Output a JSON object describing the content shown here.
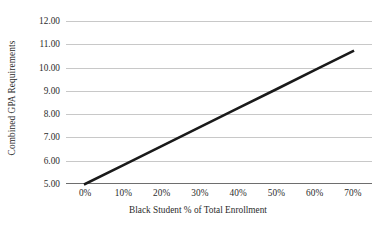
{
  "chart_data": {
    "type": "line",
    "title": "",
    "xlabel": "Black Student % of Total Enrollment",
    "ylabel": "Combined GPA Requirements",
    "x": [
      0,
      70
    ],
    "values": [
      5.0,
      10.7
    ],
    "series": [
      {
        "name": "Combined GPA Requirements",
        "x": [
          0,
          10,
          20,
          30,
          40,
          50,
          60,
          70
        ],
        "values": [
          5.0,
          5.81,
          6.63,
          7.44,
          8.26,
          9.07,
          9.89,
          10.7
        ]
      }
    ],
    "xlim": [
      -5,
      75
    ],
    "ylim": [
      5.0,
      12.0
    ],
    "x_ticks": [
      0,
      10,
      20,
      30,
      40,
      50,
      60,
      70
    ],
    "x_tick_labels": [
      "0%",
      "10%",
      "20%",
      "30%",
      "40%",
      "50%",
      "60%",
      "70%"
    ],
    "y_ticks": [
      5.0,
      6.0,
      7.0,
      8.0,
      9.0,
      10.0,
      11.0,
      12.0
    ],
    "y_tick_labels": [
      "5.00",
      "6.00",
      "7.00",
      "8.00",
      "9.00",
      "10.00",
      "11.00",
      "12.00"
    ],
    "grid": "horizontal",
    "legend": "none",
    "line_color": "#1a1a1a",
    "line_width": 2.6,
    "gridline_color": "#c8c8c8",
    "axis_color": "#6e6e6e",
    "background_color": "#ffffff"
  }
}
